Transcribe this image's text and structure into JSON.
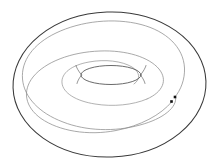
{
  "figure": {
    "canvas_width": 220,
    "canvas_height": 168,
    "background_color": "#ffffff",
    "outer_stroke_color": "#3a3a3a",
    "inner_stroke_color": "#8a8a8a",
    "mid_stroke_color": "#707070",
    "lens_stroke_color": "#5a5a5a",
    "marker_color": "#101010",
    "outer_stroke_width": 1.0,
    "inner_stroke_width": 0.7
  },
  "chart_data": {
    "type": "line",
    "subtitle": "",
    "xlabel": "",
    "ylabel": "",
    "xlim": [
      0,
      220
    ],
    "ylim": [
      0,
      168
    ],
    "grid": false,
    "legend": "none",
    "center": {
      "x": 104,
      "y": 85
    },
    "annotations": [
      {
        "name": "end-point-outer",
        "x": 175,
        "y": 97,
        "shape": "square",
        "size": 2.6
      },
      {
        "name": "end-point-inner",
        "x": 171.5,
        "y": 101.5,
        "shape": "square",
        "size": 2.6
      }
    ],
    "series": [
      {
        "name": "outer-ellipse",
        "kind": "closed-ellipse",
        "color": "#3a3a3a",
        "width": 1.05,
        "cx": 109.5,
        "cy": 84.5,
        "rx": 96.5,
        "ry": 72.5,
        "rotation_deg": -2.0
      },
      {
        "name": "spiral-arm-1",
        "kind": "open-spiral",
        "color": "#8c8c8c",
        "width": 0.75,
        "path": "M 174.5 97.5 C 181 90 185 79 184.5 68 C 183.5 47 166 31 141 24.5 C 114 17.5 81 21 56 33 C 33 44 21 61 22.5 79 C 24 97 39 113 63 122 C 86 131 115 132 140 125 C 163 119 178 107 175.5 96.5"
      },
      {
        "name": "spiral-arm-2",
        "kind": "open-spiral",
        "color": "#8c8c8c",
        "width": 0.75,
        "path": "M 172 101.5 C 161 115 140 126 116 130.5 C 88 136 59 131 41 118.5 C 25 107 22 91 33 77 C 45 62 71 52 100 51 C 126 50 149 57 159 69 C 168 80 163 92 147 99"
      },
      {
        "name": "spiral-arm-3",
        "kind": "open-spiral",
        "color": "#909090",
        "width": 0.7,
        "path": "M 147 99 C 133 105 113 107 95 104 C 76 101 63 93 62 83 C 61 73 72 65 89 62 C 105 59 122 61 132 67 C 140 72 141 79 134 84"
      },
      {
        "name": "inner-lens-ellipse",
        "kind": "closed-lens",
        "color": "#4f4f4f",
        "width": 0.85,
        "cx": 111,
        "cy": 75,
        "rx": 30,
        "ry": 9.5
      },
      {
        "name": "lens-tail-left",
        "kind": "open-arc",
        "color": "#6a6a6a",
        "width": 0.7,
        "path": "M 81.5 75 C 78 70.5 76.5 67.5 76 65.5"
      },
      {
        "name": "lens-tail-right",
        "kind": "open-arc",
        "color": "#6a6a6a",
        "width": 0.7,
        "path": "M 140.5 75 C 144 70.5 145.5 67.5 146 65.5"
      },
      {
        "name": "lens-tail-left-lower",
        "kind": "open-arc",
        "color": "#6a6a6a",
        "width": 0.7,
        "path": "M 81.5 75 C 78.5 79 77.5 81.5 77 83.5"
      },
      {
        "name": "lens-tail-right-lower",
        "kind": "open-arc",
        "color": "#6a6a6a",
        "width": 0.7,
        "path": "M 140.5 75 C 143.5 79 144.5 81.5 145 83.5"
      }
    ]
  }
}
